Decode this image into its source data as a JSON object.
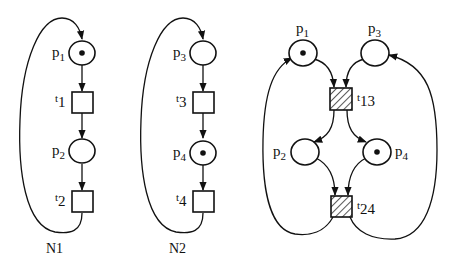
{
  "diagram": {
    "type": "petri-nets",
    "colors": {
      "stroke": "#111111",
      "background": "#ffffff"
    },
    "nets": [
      {
        "name": "N1",
        "places": [
          {
            "id": "p1",
            "base": "p",
            "sub": "1",
            "tokens": 1
          },
          {
            "id": "p2",
            "base": "p",
            "sub": "2",
            "tokens": 0
          }
        ],
        "transitions": [
          {
            "id": "t1",
            "base": "t",
            "sub": "1",
            "hatched": false
          },
          {
            "id": "t2",
            "base": "t",
            "sub": "2",
            "hatched": false
          }
        ],
        "arcs": [
          [
            "p1",
            "t1"
          ],
          [
            "t1",
            "p2"
          ],
          [
            "p2",
            "t2"
          ],
          [
            "t2",
            "p1"
          ]
        ]
      },
      {
        "name": "N2",
        "places": [
          {
            "id": "p3",
            "base": "p",
            "sub": "3",
            "tokens": 0
          },
          {
            "id": "p4",
            "base": "p",
            "sub": "4",
            "tokens": 1
          }
        ],
        "transitions": [
          {
            "id": "t3",
            "base": "t",
            "sub": "3",
            "hatched": false
          },
          {
            "id": "t4",
            "base": "t",
            "sub": "4",
            "hatched": false
          }
        ],
        "arcs": [
          [
            "p3",
            "t3"
          ],
          [
            "t3",
            "p4"
          ],
          [
            "p4",
            "t4"
          ],
          [
            "t4",
            "p3"
          ]
        ]
      },
      {
        "name": "",
        "places": [
          {
            "id": "p1",
            "base": "p",
            "sub": "1",
            "tokens": 1
          },
          {
            "id": "p3",
            "base": "p",
            "sub": "3",
            "tokens": 0
          },
          {
            "id": "p2",
            "base": "p",
            "sub": "2",
            "tokens": 0
          },
          {
            "id": "p4",
            "base": "p",
            "sub": "4",
            "tokens": 1
          }
        ],
        "transitions": [
          {
            "id": "t13",
            "base": "t",
            "sub": "13",
            "hatched": true
          },
          {
            "id": "t24",
            "base": "t",
            "sub": "24",
            "hatched": true
          }
        ],
        "arcs": [
          [
            "p1",
            "t13"
          ],
          [
            "p3",
            "t13"
          ],
          [
            "t13",
            "p2"
          ],
          [
            "t13",
            "p4"
          ],
          [
            "p2",
            "t24"
          ],
          [
            "p4",
            "t24"
          ],
          [
            "t24",
            "p1"
          ],
          [
            "t24",
            "p3"
          ]
        ]
      }
    ]
  }
}
